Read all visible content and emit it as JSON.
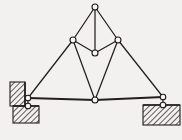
{
  "figure": {
    "background_color": "#f3f1ef",
    "line_color": "#221f1e",
    "node_fill_color": "#f6f5f3",
    "hatch_color": "#3a3735",
    "width": 182,
    "height": 140
  },
  "nodes": [
    {
      "id": "apex",
      "label": "A",
      "x": 95,
      "y": 7,
      "r": 3.0,
      "kind": "joint"
    },
    {
      "id": "upper-left",
      "label": "B",
      "x": 73,
      "y": 40,
      "r": 3.0,
      "kind": "joint"
    },
    {
      "id": "upper-right",
      "label": "C",
      "x": 118,
      "y": 40,
      "r": 3.0,
      "kind": "joint"
    },
    {
      "id": "mid-center",
      "label": "D",
      "x": 95,
      "y": 53,
      "r": 3.0,
      "kind": "joint"
    },
    {
      "id": "bottom-center",
      "label": "E",
      "x": 95,
      "y": 100,
      "r": 3.0,
      "kind": "joint"
    },
    {
      "id": "left-pin-top",
      "label": "F",
      "x": 28,
      "y": 98,
      "r": 2.8,
      "kind": "support-pin"
    },
    {
      "id": "left-pin-low",
      "label": "G",
      "x": 28,
      "y": 106,
      "r": 2.8,
      "kind": "support-pin"
    },
    {
      "id": "right-pin-top",
      "label": "H",
      "x": 163,
      "y": 97,
      "r": 2.8,
      "kind": "support-pin"
    },
    {
      "id": "right-pin-low",
      "label": "I",
      "x": 163,
      "y": 105,
      "r": 2.8,
      "kind": "support-pin"
    }
  ],
  "members": [
    {
      "id": "m1",
      "from": "apex",
      "to": "upper-left",
      "style": "member"
    },
    {
      "id": "m2",
      "from": "apex",
      "to": "upper-right",
      "style": "member"
    },
    {
      "id": "m3",
      "from": "apex",
      "to": "mid-center",
      "style": "member"
    },
    {
      "id": "m4",
      "from": "upper-left",
      "to": "mid-center",
      "style": "member"
    },
    {
      "id": "m5",
      "from": "upper-right",
      "to": "mid-center",
      "style": "member"
    },
    {
      "id": "m6",
      "from": "upper-left",
      "to": "left-pin-top",
      "style": "member"
    },
    {
      "id": "m7",
      "from": "upper-left",
      "to": "bottom-center",
      "style": "member"
    },
    {
      "id": "m8",
      "from": "upper-right",
      "to": "bottom-center",
      "style": "member"
    },
    {
      "id": "m9",
      "from": "upper-right",
      "to": "right-pin-top",
      "style": "member"
    },
    {
      "id": "m10",
      "from": "left-pin-top",
      "to": "bottom-center",
      "style": "chord"
    },
    {
      "id": "m11",
      "from": "bottom-center",
      "to": "right-pin-top",
      "style": "chord"
    },
    {
      "id": "m12",
      "from": "left-pin-top",
      "to": "left-pin-low",
      "style": "member"
    },
    {
      "id": "m13",
      "from": "right-pin-top",
      "to": "right-pin-low",
      "style": "member"
    }
  ],
  "supports": [
    {
      "id": "left-wall",
      "name": "left-wall-hatch",
      "type": "vertical-wall",
      "x": 10,
      "y": 82,
      "width": 15,
      "height": 24
    },
    {
      "id": "left-base",
      "name": "left-base-hatch",
      "type": "ground-block",
      "x": 13,
      "y": 106,
      "width": 26,
      "height": 17
    },
    {
      "id": "right-base",
      "name": "right-base-hatch",
      "type": "ground-block",
      "x": 143,
      "y": 105,
      "width": 37,
      "height": 20
    }
  ]
}
